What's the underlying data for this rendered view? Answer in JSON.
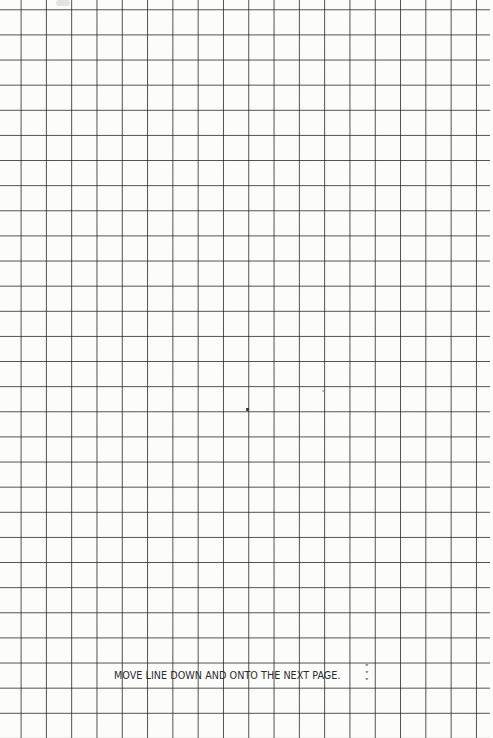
{
  "page": {
    "type": "graph-paper",
    "grid": {
      "columns": 19,
      "rows": 29,
      "cell_size_px": 25.2,
      "line_color": "#2d2d2d",
      "paper_color": "#fcfcfb"
    },
    "instruction_text": "MOVE LINE DOWN AND ONTO THE NEXT PAGE.",
    "continue_icon": [
      "˅",
      "˅",
      "˅"
    ]
  }
}
